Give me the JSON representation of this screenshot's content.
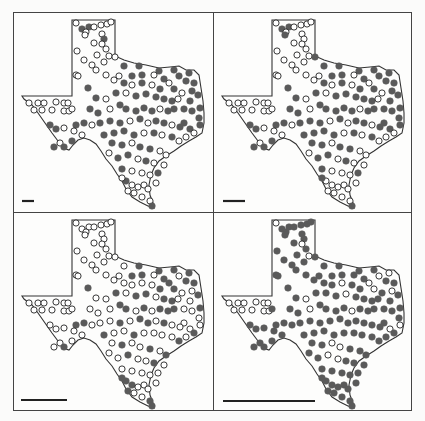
{
  "figure": {
    "layout": "2x2 grid of Texas maps",
    "colors": {
      "outline": "#333333",
      "filled": "#5a5a5a",
      "open_fill": "#ffffff",
      "open_stroke": "#222222",
      "scalebar": "#222222",
      "frame": "#444444"
    }
  },
  "outline_path": "M58,7 L101,7 L101,43 L110,47 L120,50 L132,52 L145,55 L156,54 L165,53 L172,57 L180,57 L185,62 L187,75 L189,88 L190,100 L190,110 L188,120 L182,124 L175,128 L167,133 L160,138 L152,143 L145,148 L140,155 L137,162 L135,172 L136,182 L139,190 L140,195 L134,193 L126,189 L118,184 L112,176 L108,168 L103,161 L98,153 L92,146 L87,138 L82,131 L76,127 L70,125 L64,127 L59,132 L55,137 L49,135 L44,128 L38,120 L31,110 L24,100 L18,92 L10,86 L8,83 L58,83 Z",
  "panels": [
    {
      "id": "panel-1",
      "left": 0,
      "top": 0,
      "scalebar": {
        "x1": 8,
        "x2": 20,
        "y": 188
      }
    },
    {
      "id": "panel-2",
      "left": 200,
      "top": 0,
      "scalebar": {
        "x1": 9,
        "x2": 31,
        "y": 188
      }
    },
    {
      "id": "panel-3",
      "left": 0,
      "top": 200,
      "scalebar": {
        "x1": 7,
        "x2": 53,
        "y": 187
      }
    },
    {
      "id": "panel-4",
      "left": 200,
      "top": 200,
      "scalebar": {
        "x1": 9,
        "x2": 101,
        "y": 188
      }
    }
  ],
  "stations": [
    [
      62,
      10,
      [
        0,
        0,
        0,
        0
      ]
    ],
    [
      75,
      14,
      [
        1,
        1,
        0,
        1
      ]
    ],
    [
      80,
      14,
      [
        0,
        0,
        0,
        1
      ]
    ],
    [
      87,
      12,
      [
        0,
        0,
        0,
        1
      ]
    ],
    [
      93,
      11,
      [
        0,
        0,
        0,
        1
      ]
    ],
    [
      97,
      9,
      [
        0,
        0,
        0,
        1
      ]
    ],
    [
      68,
      16,
      [
        1,
        1,
        0,
        1
      ]
    ],
    [
      72,
      19,
      [
        0,
        0,
        0,
        1
      ]
    ],
    [
      71,
      22,
      [
        0,
        1,
        0,
        1
      ]
    ],
    [
      88,
      21,
      [
        0,
        0,
        0,
        1
      ]
    ],
    [
      90,
      26,
      [
        1,
        0,
        0,
        1
      ]
    ],
    [
      80,
      30,
      [
        0,
        0,
        0,
        1
      ]
    ],
    [
      88,
      31,
      [
        0,
        0,
        0,
        0
      ]
    ],
    [
      92,
      36,
      [
        0,
        0,
        0,
        1
      ]
    ],
    [
      95,
      43,
      [
        0,
        0,
        0,
        0
      ]
    ],
    [
      83,
      42,
      [
        0,
        0,
        0,
        1
      ]
    ],
    [
      90,
      49,
      [
        0,
        0,
        0,
        1
      ]
    ],
    [
      101,
      44,
      [
        0,
        1,
        0,
        1
      ]
    ],
    [
      63,
      38,
      [
        0,
        0,
        0,
        1
      ]
    ],
    [
      70,
      47,
      [
        0,
        0,
        0,
        1
      ]
    ],
    [
      78,
      52,
      [
        0,
        0,
        0,
        1
      ]
    ],
    [
      82,
      57,
      [
        0,
        0,
        0,
        1
      ]
    ],
    [
      62,
      62,
      [
        0,
        0,
        0,
        1
      ]
    ],
    [
      64,
      63,
      [
        0,
        0,
        0,
        1
      ]
    ],
    [
      110,
      53,
      [
        1,
        1,
        0,
        1
      ]
    ],
    [
      125,
      53,
      [
        1,
        1,
        1,
        1
      ]
    ],
    [
      145,
      58,
      [
        1,
        1,
        1,
        1
      ]
    ],
    [
      160,
      57,
      [
        1,
        1,
        1,
        1
      ]
    ],
    [
      175,
      60,
      [
        1,
        1,
        1,
        0
      ]
    ],
    [
      180,
      70,
      [
        1,
        1,
        1,
        1
      ]
    ],
    [
      105,
      63,
      [
        0,
        0,
        0,
        1
      ]
    ],
    [
      118,
      63,
      [
        1,
        1,
        1,
        1
      ]
    ],
    [
      128,
      62,
      [
        1,
        1,
        1,
        1
      ]
    ],
    [
      140,
      62,
      [
        0,
        0,
        0,
        1
      ]
    ],
    [
      150,
      66,
      [
        1,
        1,
        1,
        1
      ]
    ],
    [
      165,
      63,
      [
        1,
        1,
        0,
        0
      ]
    ],
    [
      172,
      68,
      [
        1,
        1,
        1,
        1
      ]
    ],
    [
      178,
      78,
      [
        1,
        1,
        0,
        0
      ]
    ],
    [
      184,
      82,
      [
        1,
        1,
        1,
        1
      ]
    ],
    [
      186,
      95,
      [
        1,
        1,
        1,
        1
      ]
    ],
    [
      185,
      105,
      [
        1,
        1,
        0,
        1
      ]
    ],
    [
      186,
      112,
      [
        1,
        1,
        0,
        0
      ]
    ],
    [
      92,
      62,
      [
        0,
        0,
        0,
        1
      ]
    ],
    [
      100,
      67,
      [
        0,
        0,
        0,
        1
      ]
    ],
    [
      110,
      70,
      [
        1,
        1,
        0,
        1
      ]
    ],
    [
      118,
      72,
      [
        0,
        0,
        0,
        1
      ]
    ],
    [
      128,
      70,
      [
        1,
        1,
        0,
        0
      ]
    ],
    [
      138,
      72,
      [
        0,
        0,
        0,
        1
      ]
    ],
    [
      146,
      76,
      [
        1,
        1,
        1,
        1
      ]
    ],
    [
      155,
      70,
      [
        0,
        0,
        1,
        0
      ]
    ],
    [
      160,
      76,
      [
        1,
        1,
        1,
        0
      ]
    ],
    [
      168,
      80,
      [
        0,
        0,
        0,
        1
      ]
    ],
    [
      176,
      88,
      [
        1,
        1,
        0,
        1
      ]
    ],
    [
      170,
      96,
      [
        1,
        1,
        0,
        1
      ]
    ],
    [
      74,
      75,
      [
        1,
        1,
        1,
        1
      ]
    ],
    [
      82,
      85,
      [
        1,
        1,
        0,
        1
      ]
    ],
    [
      92,
      86,
      [
        0,
        0,
        0,
        0
      ]
    ],
    [
      102,
      80,
      [
        1,
        1,
        1,
        1
      ]
    ],
    [
      112,
      80,
      [
        0,
        0,
        0,
        1
      ]
    ],
    [
      122,
      83,
      [
        1,
        1,
        1,
        1
      ]
    ],
    [
      132,
      81,
      [
        1,
        1,
        1,
        0
      ]
    ],
    [
      142,
      84,
      [
        1,
        1,
        0,
        1
      ]
    ],
    [
      150,
      86,
      [
        1,
        1,
        1,
        1
      ]
    ],
    [
      158,
      88,
      [
        1,
        1,
        1,
        1
      ]
    ],
    [
      164,
      86,
      [
        0,
        0,
        0,
        1
      ]
    ],
    [
      178,
      98,
      [
        1,
        1,
        0,
        1
      ]
    ],
    [
      20,
      97,
      [
        0,
        0,
        0,
        0
      ]
    ],
    [
      28,
      97,
      [
        0,
        0,
        0,
        0
      ]
    ],
    [
      38,
      97,
      [
        0,
        0,
        0,
        0
      ]
    ],
    [
      50,
      98,
      [
        0,
        0,
        0,
        0
      ]
    ],
    [
      55,
      98,
      [
        0,
        0,
        0,
        0
      ]
    ],
    [
      58,
      96,
      [
        0,
        0,
        0,
        1
      ]
    ],
    [
      15,
      90,
      [
        0,
        0,
        0,
        0
      ]
    ],
    [
      24,
      90,
      [
        0,
        0,
        0,
        0
      ]
    ],
    [
      30,
      90,
      [
        0,
        0,
        0,
        0
      ]
    ],
    [
      42,
      89,
      [
        0,
        0,
        0,
        0
      ]
    ],
    [
      50,
      90,
      [
        0,
        0,
        0,
        0
      ]
    ],
    [
      54,
      90,
      [
        0,
        0,
        0,
        0
      ]
    ],
    [
      76,
      96,
      [
        1,
        1,
        0,
        1
      ]
    ],
    [
      84,
      100,
      [
        1,
        1,
        0,
        1
      ]
    ],
    [
      96,
      96,
      [
        0,
        0,
        0,
        0
      ]
    ],
    [
      106,
      92,
      [
        1,
        1,
        1,
        1
      ]
    ],
    [
      112,
      96,
      [
        1,
        1,
        1,
        1
      ]
    ],
    [
      122,
      98,
      [
        1,
        1,
        0,
        1
      ]
    ],
    [
      130,
      95,
      [
        1,
        1,
        1,
        1
      ]
    ],
    [
      138,
      98,
      [
        1,
        1,
        0,
        0
      ]
    ],
    [
      146,
      96,
      [
        0,
        0,
        1,
        1
      ]
    ],
    [
      154,
      98,
      [
        1,
        1,
        1,
        1
      ]
    ],
    [
      160,
      96,
      [
        1,
        1,
        1,
        1
      ]
    ],
    [
      170,
      110,
      [
        1,
        1,
        0,
        1
      ]
    ],
    [
      36,
      112,
      [
        1,
        1,
        0,
        1
      ]
    ],
    [
      42,
      116,
      [
        1,
        1,
        0,
        1
      ]
    ],
    [
      50,
      115,
      [
        0,
        0,
        0,
        1
      ]
    ],
    [
      62,
      112,
      [
        1,
        1,
        1,
        1
      ]
    ],
    [
      70,
      110,
      [
        1,
        1,
        1,
        1
      ]
    ],
    [
      78,
      112,
      [
        0,
        0,
        0,
        1
      ]
    ],
    [
      86,
      110,
      [
        1,
        1,
        0,
        1
      ]
    ],
    [
      96,
      108,
      [
        1,
        1,
        0,
        1
      ]
    ],
    [
      106,
      110,
      [
        1,
        1,
        1,
        1
      ]
    ],
    [
      116,
      108,
      [
        0,
        0,
        0,
        1
      ]
    ],
    [
      126,
      106,
      [
        1,
        1,
        1,
        1
      ]
    ],
    [
      134,
      110,
      [
        0,
        0,
        1,
        1
      ]
    ],
    [
      142,
      108,
      [
        1,
        1,
        0,
        1
      ]
    ],
    [
      150,
      110,
      [
        1,
        1,
        1,
        1
      ]
    ],
    [
      158,
      112,
      [
        0,
        0,
        0,
        1
      ]
    ],
    [
      166,
      114,
      [
        1,
        1,
        0,
        1
      ]
    ],
    [
      176,
      116,
      [
        1,
        1,
        0,
        0
      ]
    ],
    [
      180,
      120,
      [
        0,
        0,
        1,
        1
      ]
    ],
    [
      60,
      118,
      [
        0,
        0,
        0,
        1
      ]
    ],
    [
      68,
      122,
      [
        0,
        0,
        0,
        1
      ]
    ],
    [
      58,
      128,
      [
        1,
        1,
        0,
        1
      ]
    ],
    [
      46,
      130,
      [
        0,
        0,
        0,
        1
      ]
    ],
    [
      50,
      134,
      [
        1,
        1,
        1,
        1
      ]
    ],
    [
      40,
      134,
      [
        1,
        1,
        0,
        1
      ]
    ],
    [
      90,
      122,
      [
        1,
        1,
        1,
        1
      ]
    ],
    [
      100,
      120,
      [
        1,
        1,
        0,
        1
      ]
    ],
    [
      110,
      118,
      [
        1,
        1,
        0,
        1
      ]
    ],
    [
      120,
      122,
      [
        1,
        1,
        1,
        1
      ]
    ],
    [
      130,
      120,
      [
        0,
        0,
        0,
        1
      ]
    ],
    [
      140,
      120,
      [
        1,
        1,
        0,
        1
      ]
    ],
    [
      148,
      122,
      [
        0,
        0,
        0,
        1
      ]
    ],
    [
      158,
      124,
      [
        1,
        1,
        0,
        1
      ]
    ],
    [
      165,
      128,
      [
        0,
        0,
        1,
        1
      ]
    ],
    [
      172,
      124,
      [
        0,
        0,
        0,
        1
      ]
    ],
    [
      98,
      130,
      [
        1,
        1,
        0,
        1
      ]
    ],
    [
      108,
      132,
      [
        1,
        1,
        1,
        1
      ]
    ],
    [
      118,
      130,
      [
        0,
        0,
        0,
        0
      ]
    ],
    [
      126,
      134,
      [
        1,
        1,
        0,
        0
      ]
    ],
    [
      136,
      136,
      [
        1,
        1,
        1,
        1
      ]
    ],
    [
      146,
      138,
      [
        0,
        0,
        0,
        1
      ]
    ],
    [
      152,
      142,
      [
        0,
        0,
        1,
        1
      ]
    ],
    [
      95,
      140,
      [
        0,
        0,
        0,
        1
      ]
    ],
    [
      104,
      145,
      [
        1,
        1,
        0,
        1
      ]
    ],
    [
      114,
      142,
      [
        1,
        1,
        1,
        0
      ]
    ],
    [
      124,
      146,
      [
        0,
        0,
        0,
        0
      ]
    ],
    [
      132,
      148,
      [
        1,
        1,
        0,
        1
      ]
    ],
    [
      140,
      150,
      [
        0,
        0,
        1,
        1
      ]
    ],
    [
      108,
      156,
      [
        1,
        1,
        0,
        1
      ]
    ],
    [
      118,
      158,
      [
        0,
        0,
        0,
        1
      ]
    ],
    [
      128,
      160,
      [
        0,
        0,
        0,
        1
      ]
    ],
    [
      136,
      162,
      [
        0,
        0,
        0,
        1
      ]
    ],
    [
      112,
      168,
      [
        1,
        0,
        1,
        1
      ]
    ],
    [
      118,
      172,
      [
        0,
        0,
        1,
        1
      ]
    ],
    [
      124,
      174,
      [
        0,
        0,
        0,
        1
      ]
    ],
    [
      130,
      172,
      [
        0,
        0,
        0,
        1
      ]
    ],
    [
      134,
      176,
      [
        0,
        0,
        0,
        1
      ]
    ],
    [
      120,
      180,
      [
        0,
        0,
        0,
        1
      ]
    ],
    [
      128,
      184,
      [
        0,
        0,
        0,
        1
      ]
    ],
    [
      136,
      188,
      [
        0,
        0,
        1,
        1
      ]
    ],
    [
      138,
      193,
      [
        1,
        1,
        1,
        1
      ]
    ],
    [
      114,
      178,
      [
        0,
        0,
        1,
        1
      ]
    ],
    [
      108,
      165,
      [
        0,
        1,
        1,
        1
      ]
    ],
    [
      142,
      170,
      [
        0,
        0,
        0,
        1
      ]
    ],
    [
      144,
      160,
      [
        1,
        1,
        0,
        1
      ]
    ],
    [
      150,
      152,
      [
        0,
        0,
        0,
        1
      ]
    ]
  ]
}
